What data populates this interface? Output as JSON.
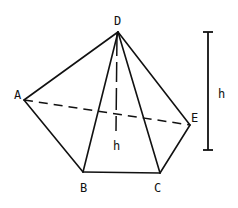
{
  "figure": {
    "type": "pentagonal pyramid",
    "apex": "D",
    "base_vertices": [
      "A",
      "B",
      "C",
      "E"
    ],
    "vertices": {
      "D": {
        "label": "D"
      },
      "A": {
        "label": "A"
      },
      "B": {
        "label": "B"
      },
      "C": {
        "label": "C"
      },
      "E": {
        "label": "E"
      }
    },
    "height_label_inner": "h",
    "height_label_scale": "h"
  }
}
